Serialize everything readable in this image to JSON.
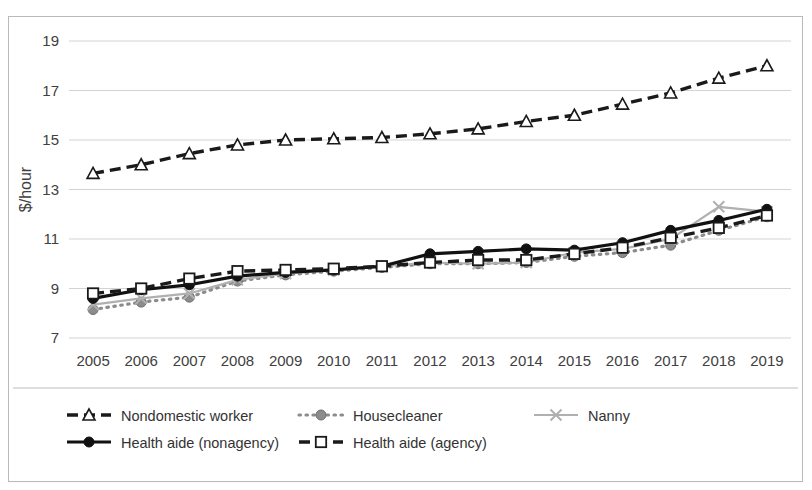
{
  "chart_data": {
    "type": "line",
    "title": "",
    "xlabel": "",
    "ylabel": "$/hour",
    "categories": [
      2005,
      2006,
      2007,
      2008,
      2009,
      2010,
      2011,
      2012,
      2013,
      2014,
      2015,
      2016,
      2017,
      2018,
      2019
    ],
    "ylim": [
      7,
      19
    ],
    "yticks": [
      7,
      9,
      11,
      13,
      15,
      17,
      19
    ],
    "grid": true,
    "legend_position": "bottom",
    "series": [
      {
        "name": "Nondomestic worker",
        "marker": "triangle-open",
        "line": "dashed",
        "color": "#1a1a1a",
        "values": [
          13.65,
          14.0,
          14.45,
          14.8,
          15.0,
          15.05,
          15.1,
          15.25,
          15.45,
          15.75,
          16.0,
          16.45,
          16.9,
          17.5,
          18.0
        ]
      },
      {
        "name": "Housecleaner",
        "marker": "circle-filled",
        "line": "dotted",
        "color": "#8c8c8c",
        "values": [
          8.15,
          8.45,
          8.65,
          9.3,
          9.55,
          9.7,
          9.85,
          10.0,
          10.0,
          10.05,
          10.3,
          10.45,
          10.75,
          11.35,
          11.9
        ]
      },
      {
        "name": "Nanny",
        "marker": "x",
        "line": "solid",
        "color": "#b0b0b0",
        "values": [
          8.35,
          8.6,
          8.8,
          9.35,
          9.6,
          9.75,
          9.9,
          10.05,
          10.0,
          10.05,
          10.45,
          10.6,
          11.0,
          12.3,
          12.1
        ]
      },
      {
        "name": "Health aide (nonagency)",
        "marker": "circle-filled",
        "line": "solid",
        "color": "#111111",
        "values": [
          8.6,
          8.95,
          9.15,
          9.5,
          9.65,
          9.75,
          9.9,
          10.4,
          10.5,
          10.6,
          10.55,
          10.85,
          11.35,
          11.75,
          12.2
        ]
      },
      {
        "name": "Health aide (agency)",
        "marker": "square-open",
        "line": "dashed",
        "color": "#1a1a1a",
        "values": [
          8.8,
          9.0,
          9.4,
          9.7,
          9.75,
          9.8,
          9.9,
          10.05,
          10.15,
          10.15,
          10.4,
          10.65,
          11.05,
          11.45,
          11.95
        ]
      }
    ]
  }
}
